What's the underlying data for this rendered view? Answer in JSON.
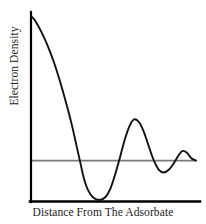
{
  "chart_data": {
    "type": "line",
    "title": "",
    "subtitle": "",
    "xlabel": "Distance From The Adsorbate",
    "ylabel": "Electron Density",
    "grid": false,
    "legend": null,
    "axis_ticks": {
      "x": [],
      "y": []
    },
    "xlim": [
      0,
      1
    ],
    "ylim": [
      0,
      1
    ],
    "reference_line": {
      "name": "bulk-electron-density-level",
      "orientation": "horizontal",
      "y": 0.215,
      "color": "#7a7a7a"
    },
    "series": [
      {
        "name": "electron-density",
        "color": "#111111",
        "points": [
          {
            "x": 0.0,
            "y": 1.0
          },
          {
            "x": 0.012,
            "y": 0.995
          },
          {
            "x": 0.035,
            "y": 0.965
          },
          {
            "x": 0.065,
            "y": 0.915
          },
          {
            "x": 0.1,
            "y": 0.845
          },
          {
            "x": 0.14,
            "y": 0.75
          },
          {
            "x": 0.175,
            "y": 0.65
          },
          {
            "x": 0.21,
            "y": 0.54
          },
          {
            "x": 0.245,
            "y": 0.42
          },
          {
            "x": 0.275,
            "y": 0.3
          },
          {
            "x": 0.3,
            "y": 0.2
          },
          {
            "x": 0.32,
            "y": 0.12
          },
          {
            "x": 0.345,
            "y": 0.055
          },
          {
            "x": 0.375,
            "y": 0.015
          },
          {
            "x": 0.415,
            "y": 0.0
          },
          {
            "x": 0.45,
            "y": 0.015
          },
          {
            "x": 0.48,
            "y": 0.06
          },
          {
            "x": 0.51,
            "y": 0.14
          },
          {
            "x": 0.54,
            "y": 0.235
          },
          {
            "x": 0.565,
            "y": 0.32
          },
          {
            "x": 0.595,
            "y": 0.4
          },
          {
            "x": 0.625,
            "y": 0.44
          },
          {
            "x": 0.655,
            "y": 0.425
          },
          {
            "x": 0.685,
            "y": 0.37
          },
          {
            "x": 0.715,
            "y": 0.29
          },
          {
            "x": 0.745,
            "y": 0.215
          },
          {
            "x": 0.775,
            "y": 0.165
          },
          {
            "x": 0.805,
            "y": 0.15
          },
          {
            "x": 0.835,
            "y": 0.165
          },
          {
            "x": 0.865,
            "y": 0.2
          },
          {
            "x": 0.895,
            "y": 0.245
          },
          {
            "x": 0.92,
            "y": 0.268
          },
          {
            "x": 0.945,
            "y": 0.258
          },
          {
            "x": 0.97,
            "y": 0.23
          },
          {
            "x": 1.0,
            "y": 0.215
          }
        ]
      }
    ],
    "features": {
      "peak_at_surface": {
        "x": 0.0,
        "y": 1.0
      },
      "first_minimum": {
        "x": 0.415,
        "y": 0.0
      },
      "first_overshoot_maximum": {
        "x": 0.625,
        "y": 0.44
      },
      "second_minimum": {
        "x": 0.805,
        "y": 0.15
      },
      "second_overshoot_maximum": {
        "x": 0.92,
        "y": 0.268
      }
    },
    "axes_style": {
      "x_axis_color": "#000000",
      "y_axis_color": "#000000",
      "axis_width_px": 2,
      "background": "#ffffff"
    }
  }
}
